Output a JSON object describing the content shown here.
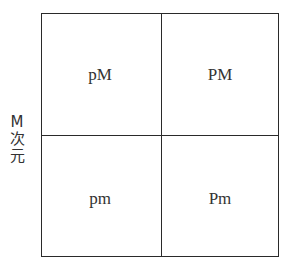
{
  "diagram": {
    "type": "2x2 matrix",
    "axis_label": {
      "chars": [
        "M",
        "次",
        "元"
      ],
      "text": "M次元"
    },
    "cells": {
      "top_left": "pM",
      "top_right": "PM",
      "bottom_left": "pm",
      "bottom_right": "Pm"
    },
    "colors": {
      "line": "#2a2a2a",
      "text": "#333333",
      "background": "#ffffff"
    }
  }
}
